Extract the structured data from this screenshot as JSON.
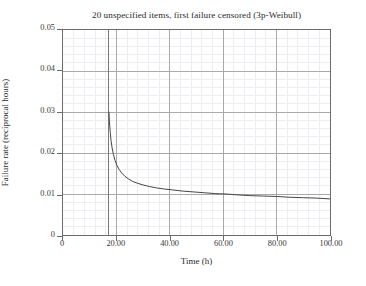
{
  "chart_data": {
    "type": "line",
    "title": "20 unspecified items, first failure censored (3p-Weibull)",
    "xlabel": "Time (h)",
    "ylabel": "Failure rate (reciprocal hours)",
    "xlim": [
      0,
      100
    ],
    "ylim": [
      0,
      0.05
    ],
    "xticks": [
      0,
      20,
      40,
      60,
      80,
      100
    ],
    "xtick_labels": [
      "0",
      "20.00",
      "40.00",
      "60.00",
      "80.00",
      "100.00"
    ],
    "yticks": [
      0,
      0.01,
      0.02,
      0.03,
      0.04,
      0.05
    ],
    "ytick_labels": [
      "0",
      "0.01",
      "0.02",
      "0.03",
      "0.04",
      "0.05"
    ],
    "grid": true,
    "minor_grid": true,
    "minor_grid_divisions": 5,
    "legend": null,
    "series": [
      {
        "name": "hazard rate",
        "color": "#444444",
        "x": [
          17.2,
          17.4,
          17.7,
          18.0,
          18.4,
          18.9,
          19.5,
          20.2,
          21.0,
          22.0,
          23.2,
          24.5,
          26.0,
          28.0,
          30.0,
          32.5,
          35.0,
          38.0,
          41.0,
          45.0,
          49.0,
          53.0,
          57.0,
          61.0,
          65.0,
          70.0,
          75.0,
          80.0,
          85.0,
          90.0,
          95.0,
          100.0
        ],
        "y": [
          0.03,
          0.0276,
          0.025,
          0.023,
          0.0212,
          0.0196,
          0.0182,
          0.017,
          0.016,
          0.0151,
          0.0143,
          0.0137,
          0.0131,
          0.0126,
          0.0122,
          0.0118,
          0.0115,
          0.0112,
          0.011,
          0.0107,
          0.0105,
          0.0103,
          0.0101,
          0.01,
          0.0098,
          0.0096,
          0.0095,
          0.0094,
          0.0092,
          0.0091,
          0.009,
          0.0088
        ]
      }
    ],
    "vertical_markers": [
      {
        "name": "first-failure-censor-line",
        "x": 17.2,
        "color": "#777777"
      }
    ]
  }
}
